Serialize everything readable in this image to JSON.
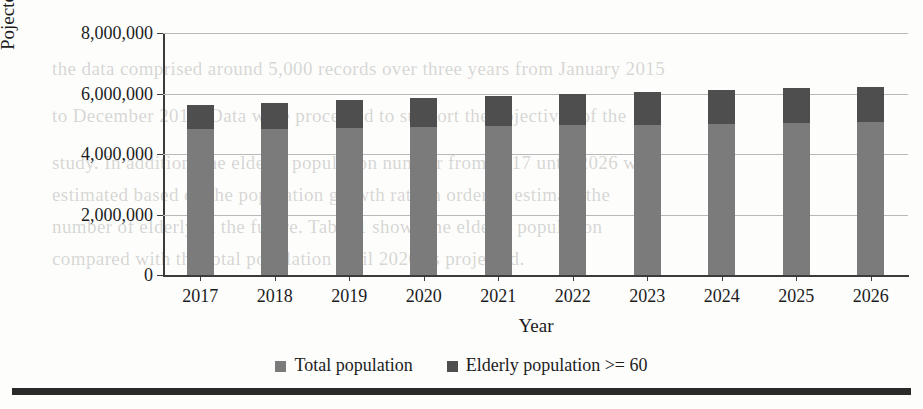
{
  "chart_data": {
    "type": "bar",
    "stacked": true,
    "title": "",
    "xlabel": "Year",
    "ylabel": "Pojected population",
    "categories": [
      "2017",
      "2018",
      "2019",
      "2020",
      "2021",
      "2022",
      "2023",
      "2024",
      "2025",
      "2026"
    ],
    "ylim": [
      0,
      8000000
    ],
    "yticks": [
      0,
      2000000,
      4000000,
      6000000,
      8000000
    ],
    "ytick_labels": [
      "0",
      "2,000,000",
      "4,000,000",
      "6,000,000",
      "8,000,000"
    ],
    "grid": true,
    "legend_position": "bottom",
    "series": [
      {
        "name": "Total population",
        "color": "#7b7b7b",
        "values": [
          4820000,
          4840000,
          4870000,
          4900000,
          4930000,
          4950000,
          4970000,
          5000000,
          5030000,
          5050000
        ]
      },
      {
        "name": "Elderly population >= 60",
        "color": "#4e4e4e",
        "values": [
          800000,
          860000,
          910000,
          960000,
          1000000,
          1050000,
          1090000,
          1120000,
          1160000,
          1180000
        ]
      }
    ],
    "totals": [
      5620000,
      5700000,
      5780000,
      5860000,
      5930000,
      6000000,
      6060000,
      6120000,
      6190000,
      6230000
    ]
  },
  "legend": {
    "items": [
      {
        "label": "Total population",
        "color": "#7b7b7b"
      },
      {
        "label": "Elderly population >= 60",
        "color": "#4e4e4e"
      }
    ]
  },
  "bleed_text": [
    "the data comprised around 5,000 records over three years from January 2015",
    "to December 2017. Data were processed to support the objectives of the",
    "study. In addition, the elderly population number from 2017 until 2026 was",
    "estimated based on the population growth rate in order to estimate the",
    "number of elderly in the future. Table 1 shows the elderly population",
    "compared with the total population until 2026 as projected."
  ]
}
